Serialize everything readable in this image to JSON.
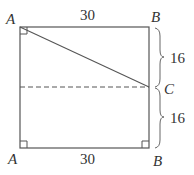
{
  "diagram": {
    "labels": {
      "top_left": "A",
      "top_right": "B",
      "bottom_left": "A",
      "bottom_right": "B",
      "mid_right": "C"
    },
    "dimensions": {
      "top_width": "30",
      "bottom_width": "30",
      "upper_height": "16",
      "lower_height": "16"
    },
    "colors": {
      "stroke": "#555555",
      "text": "#333333"
    }
  }
}
